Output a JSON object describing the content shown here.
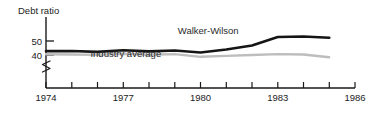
{
  "chart_data": {
    "type": "line",
    "title": "",
    "subtitle": "",
    "ylabel": "Debt ratio",
    "xlabel": "",
    "y_ticks": [
      "50",
      "40"
    ],
    "y_tick_values": [
      50,
      40
    ],
    "ylim": [
      36,
      57
    ],
    "y_axis_break": true,
    "x": [
      1974,
      1975,
      1976,
      1977,
      1978,
      1979,
      1980,
      1981,
      1982,
      1983,
      1984,
      1985
    ],
    "x_ticks": [
      "1974",
      "1977",
      "1980",
      "1983",
      "1986"
    ],
    "x_tick_values": [
      1974,
      1977,
      1980,
      1983,
      1986
    ],
    "xlim": [
      1974,
      1986
    ],
    "grid": false,
    "legend_position": "inline-annotations",
    "series": [
      {
        "name": "Walker-Wilson",
        "color": "#151515",
        "label_x": 1980.3,
        "label_y": 55.2,
        "values": [
          42.8,
          42.9,
          42.2,
          43.4,
          42.6,
          43.2,
          41.8,
          43.9,
          46.8,
          52.9,
          53.2,
          52.3
        ]
      },
      {
        "name": "Industry average",
        "color": "#bdbdbd",
        "label_x": 1977.1,
        "label_y": 38.5,
        "values": [
          40.5,
          40.4,
          40.1,
          40.9,
          40.2,
          40.6,
          38.7,
          39.4,
          40.0,
          40.6,
          40.4,
          38.4
        ]
      }
    ],
    "colors": {
      "axis": "#1a1a1a",
      "text": "#222222",
      "background": "#ffffff",
      "walker_wilson": "#151515",
      "industry_average": "#bdbdbd"
    }
  }
}
